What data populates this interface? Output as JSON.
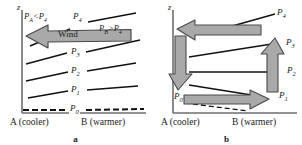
{
  "figure": {
    "panels": [
      {
        "id": "a",
        "caption": "a",
        "z_axis_label": "z",
        "x_left_label": "A (cooler)",
        "x_right_label": "B (warmer)",
        "wind_arrow_label": "Wind",
        "pressure_left_annotation": "P",
        "pressure_left_annotation_sub": "A",
        "pressure_left_annotation_rest": "<P",
        "pressure_left_annotation_rest_sub": "4",
        "pressure_right_annotation": "P",
        "pressure_right_annotation_sub": "B",
        "pressure_right_annotation_rest": ">P",
        "pressure_right_annotation_rest_sub": "4",
        "isobars": [
          {
            "name": "P",
            "sub": "0",
            "style": "dashed"
          },
          {
            "name": "P",
            "sub": "1",
            "style": "solid"
          },
          {
            "name": "P",
            "sub": "2",
            "style": "solid"
          },
          {
            "name": "P",
            "sub": "3",
            "style": "solid"
          },
          {
            "name": "P",
            "sub": "4",
            "style": "solid"
          }
        ]
      },
      {
        "id": "b",
        "caption": "b",
        "z_axis_label": "z",
        "x_left_label": "A (cooler)",
        "x_right_label": "B (warmer)",
        "isobars": [
          {
            "name": "P",
            "sub": "0",
            "style": "dashed"
          },
          {
            "name": "P",
            "sub": "1",
            "style": "solid"
          },
          {
            "name": "P",
            "sub": "2",
            "style": "solid"
          },
          {
            "name": "P",
            "sub": "3",
            "style": "solid"
          },
          {
            "name": "P",
            "sub": "4",
            "style": "solid"
          }
        ],
        "circulation_arrows": [
          {
            "name": "top-leftward-arrow",
            "direction": "left",
            "at_level": "P4"
          },
          {
            "name": "left-downward-arrow",
            "direction": "down",
            "side": "A"
          },
          {
            "name": "bottom-rightward-arrow",
            "direction": "right",
            "at_level": "P0"
          },
          {
            "name": "right-upward-arrow",
            "direction": "up",
            "side": "B"
          }
        ]
      }
    ]
  },
  "colors": {
    "arrow_fill": "#a9a9a9",
    "arrow_stroke": "#4a4a4a",
    "line": "#111111",
    "axis": "#6e6e6e",
    "text": "#1a1a1a",
    "background": "#ffffff"
  }
}
